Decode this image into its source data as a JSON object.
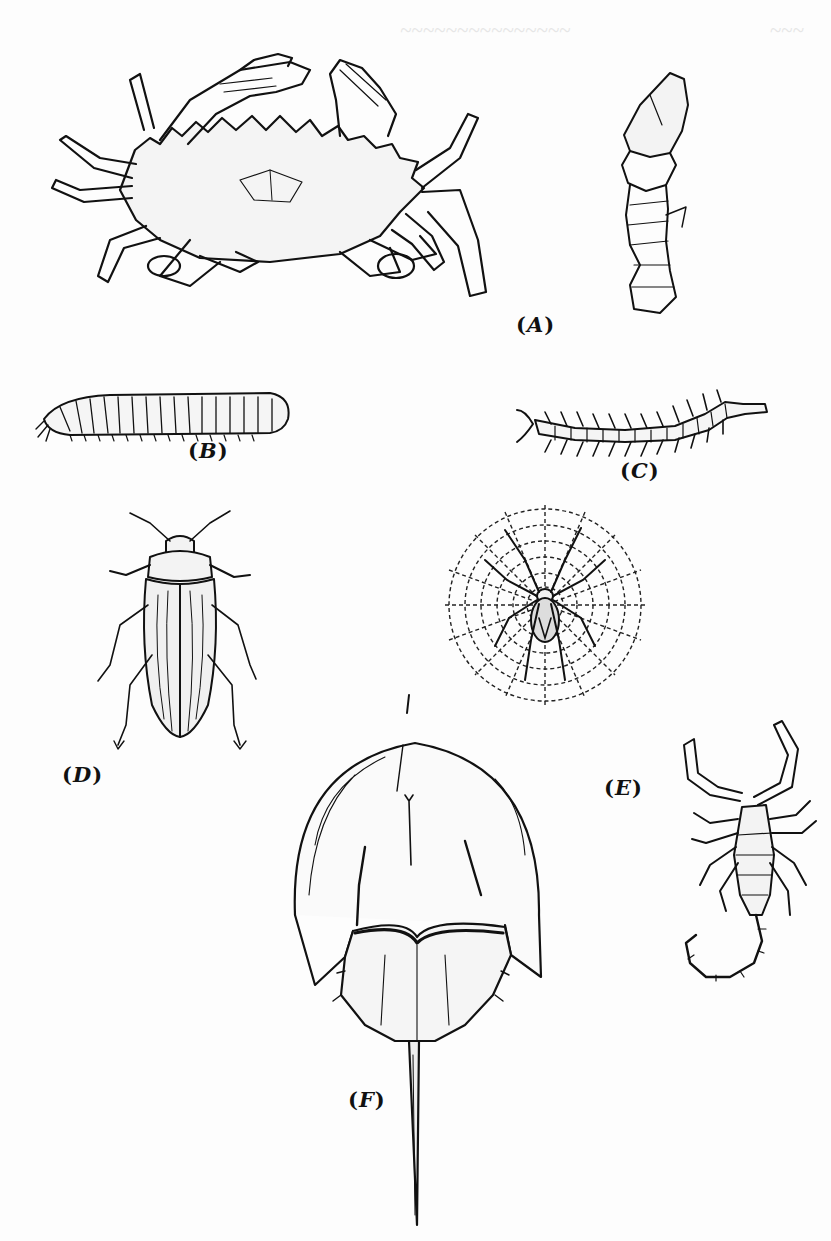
{
  "page": {
    "type": "scanned-book-page",
    "background_color": "#fdfdfd",
    "ink_color": "#111111",
    "bleed_through_color": "#e8e8e8"
  },
  "figure_plate": {
    "panels": [
      {
        "id": "A",
        "label": "A",
        "subject": "crab-and-lobster-claw"
      },
      {
        "id": "B",
        "label": "B",
        "subject": "millipede"
      },
      {
        "id": "C",
        "label": "C",
        "subject": "centipede"
      },
      {
        "id": "D",
        "label": "D",
        "subject": "beetle"
      },
      {
        "id": "spider",
        "label": "",
        "subject": "spider-on-web"
      },
      {
        "id": "E",
        "label": "E",
        "subject": "scorpion"
      },
      {
        "id": "F",
        "label": "F",
        "subject": "horseshoe-crab"
      }
    ]
  },
  "labels": {
    "open": "(",
    "close": ")",
    "A": "A",
    "B": "B",
    "C": "C",
    "D": "D",
    "E": "E",
    "F": "F"
  }
}
